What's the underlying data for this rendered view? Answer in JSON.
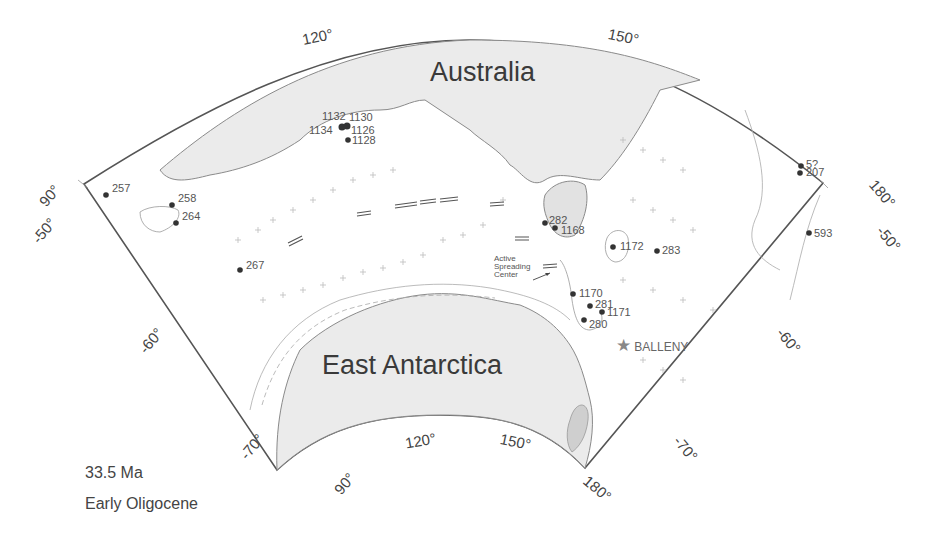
{
  "map": {
    "continents": {
      "australia": "Australia",
      "antarctica": "East Antarctica"
    },
    "caption": {
      "age": "33.5 Ma",
      "epoch": "Early Oligocene"
    },
    "longitude_ticks_top": [
      "120°",
      "150°"
    ],
    "longitude_ticks_bottom": [
      "90°",
      "120°",
      "150°",
      "180°"
    ],
    "left_edge_labels": [
      "90°",
      "-50°",
      "-60°",
      "-70°"
    ],
    "right_edge_labels": [
      "180°",
      "-50°",
      "-60°",
      "-70°"
    ],
    "sites": [
      {
        "id": "1132",
        "x": 341,
        "y": 125
      },
      {
        "id": "1130",
        "x": 349,
        "y": 124
      },
      {
        "id": "1134",
        "x": 340,
        "y": 128
      },
      {
        "id": "1126",
        "x": 347,
        "y": 127
      },
      {
        "id": "1128",
        "x": 348,
        "y": 139
      },
      {
        "id": "257",
        "x": 106,
        "y": 195
      },
      {
        "id": "258",
        "x": 172,
        "y": 205
      },
      {
        "id": "264",
        "x": 176,
        "y": 223
      },
      {
        "id": "267",
        "x": 240,
        "y": 270
      },
      {
        "id": "282",
        "x": 545,
        "y": 223
      },
      {
        "id": "1168",
        "x": 555,
        "y": 228
      },
      {
        "id": "1172",
        "x": 613,
        "y": 247
      },
      {
        "id": "283",
        "x": 657,
        "y": 251
      },
      {
        "id": "5?",
        "x": 801,
        "y": 166
      },
      {
        "id": "207",
        "x": 800,
        "y": 173
      },
      {
        "id": "593",
        "x": 809,
        "y": 233
      },
      {
        "id": "1170",
        "x": 573,
        "y": 294
      },
      {
        "id": "281",
        "x": 590,
        "y": 306
      },
      {
        "id": "1171",
        "x": 602,
        "y": 312
      },
      {
        "id": "280",
        "x": 584,
        "y": 320
      }
    ],
    "annotation_spreading": "Active\nSpreading\nCenter",
    "balleny": {
      "label": "BALLENY",
      "symbol": "★"
    },
    "colors": {
      "land": "#ebebeb",
      "coastline": "#8a8a8a",
      "frame": "#555555",
      "site_dot": "#333333",
      "star": "#888888"
    }
  }
}
